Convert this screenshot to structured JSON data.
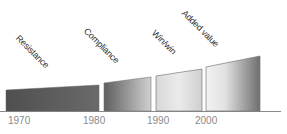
{
  "diagram": {
    "stages": [
      {
        "label": "Resistance"
      },
      {
        "label": "Compliance"
      },
      {
        "label": "Win/win"
      },
      {
        "label": "Added value"
      }
    ],
    "years": [
      "1970",
      "1980",
      "1990",
      "2000"
    ],
    "colors": {
      "resistance_start": "#4f4f4f",
      "resistance_end": "#6a6a6a",
      "compliance_start": "#5e5e5e",
      "compliance_end": "#d0d0d0",
      "winwin_start": "#dcdcdc",
      "winwin_end": "#cfcfcf",
      "added_start": "#f0f0f0",
      "added_end": "#6e6e6e",
      "axis": "#8a8a8a",
      "outline": "#7a7a7a"
    }
  }
}
